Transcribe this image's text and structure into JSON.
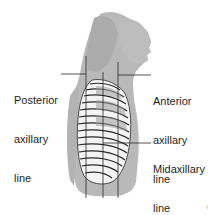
{
  "figure": {
    "colors": {
      "background": "#ffffff",
      "body": "#b9b9b9",
      "body_shadow": "#a8a8a8",
      "rib_fill": "#f4f4f4",
      "rib_stroke": "#2a2a2a",
      "line": "#2a2a2a",
      "text": "#1f1f1f"
    },
    "lines": [
      {
        "id": "posterior",
        "x": 86
      },
      {
        "id": "midaxillary",
        "x": 103
      },
      {
        "id": "anterior",
        "x": 118
      }
    ]
  },
  "labels": {
    "posterior": {
      "line1": "Posterior",
      "line2": "axillary",
      "line3": "line"
    },
    "anterior": {
      "line1": "Anterior",
      "line2": "axillary",
      "line3": "line"
    },
    "midaxillary": {
      "line1": "Midaxillary",
      "line2": "line"
    }
  },
  "page_mark": "ı"
}
